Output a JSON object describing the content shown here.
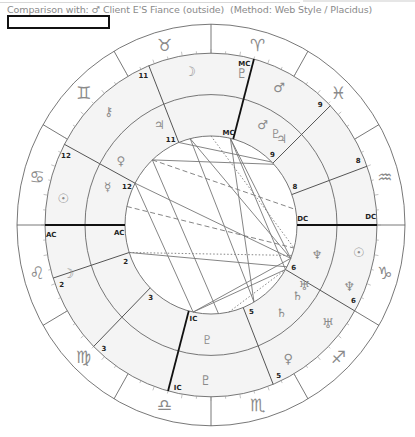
{
  "header": {
    "comparison_label": "Comparison with:",
    "comparison_symbol": "♂",
    "comparison_name": "Client E'S Fiance (outside)",
    "method": "(Method: Web Style / Placidus)",
    "name_box_value": ""
  },
  "wheel": {
    "center": [
      211,
      225
    ],
    "radii": {
      "outer": 194,
      "zodiac_inner": 166,
      "middle": 126,
      "inner": 86
    },
    "y_scale": 1.035,
    "colors": {
      "ring_fill": "#f4f4f4",
      "line": "#555555",
      "axis": "#111111",
      "glyph": "#8a8a8a",
      "label": "#222222"
    },
    "zodiac": [
      {
        "sign": "Aquarius",
        "glyph": "♒",
        "angle": 15
      },
      {
        "sign": "Pisces",
        "glyph": "♓",
        "angle": 45
      },
      {
        "sign": "Aries",
        "glyph": "♈",
        "angle": 75
      },
      {
        "sign": "Taurus",
        "glyph": "♉",
        "angle": 105
      },
      {
        "sign": "Gemini",
        "glyph": "♊",
        "angle": 135
      },
      {
        "sign": "Cancer",
        "glyph": "♋",
        "angle": 165
      },
      {
        "sign": "Leo",
        "glyph": "♌",
        "angle": 195
      },
      {
        "sign": "Virgo",
        "glyph": "♍",
        "angle": 225
      },
      {
        "sign": "Libra",
        "glyph": "♎",
        "angle": 255
      },
      {
        "sign": "Scorpio",
        "glyph": "♏",
        "angle": 285
      },
      {
        "sign": "Sagittarius",
        "glyph": "♐",
        "angle": 315
      },
      {
        "sign": "Capricorn",
        "glyph": "♑",
        "angle": 345
      }
    ],
    "outer_houses": [
      {
        "label": "AC",
        "angle": 180,
        "bold": true
      },
      {
        "label": "2",
        "angle": 198
      },
      {
        "label": "3",
        "angle": 225
      },
      {
        "label": "IC",
        "angle": 255,
        "bold": true
      },
      {
        "label": "5",
        "angle": 292
      },
      {
        "label": "6",
        "angle": 330
      },
      {
        "label": "DC",
        "angle": 0,
        "bold": true
      },
      {
        "label": "8",
        "angle": 20
      },
      {
        "label": "9",
        "angle": 44
      },
      {
        "label": "MC",
        "angle": 75,
        "bold": true
      },
      {
        "label": "11",
        "angle": 112
      },
      {
        "label": "12",
        "angle": 152
      }
    ],
    "inner_houses": [
      {
        "label": "AC",
        "angle": 180,
        "bold": true
      },
      {
        "label": "2",
        "angle": 198
      },
      {
        "label": "3",
        "angle": 225
      },
      {
        "label": "IC",
        "angle": 255,
        "bold": true
      },
      {
        "label": "5",
        "angle": 292
      },
      {
        "label": "6",
        "angle": 330
      },
      {
        "label": "DC",
        "angle": 0,
        "bold": true
      },
      {
        "label": "8",
        "angle": 20
      },
      {
        "label": "9",
        "angle": 44
      },
      {
        "label": "MC",
        "angle": 75,
        "bold": true
      },
      {
        "label": "11",
        "angle": 112
      },
      {
        "label": "12",
        "angle": 152
      }
    ],
    "outer_planets": [
      {
        "name": "Moon",
        "glyph": "☽",
        "angle": 98
      },
      {
        "name": "Pluto",
        "glyph": "♇",
        "angle": 78
      },
      {
        "name": "Mars",
        "glyph": "♂",
        "angle": 63
      },
      {
        "name": "Chiron",
        "glyph": "⚷",
        "angle": 133
      },
      {
        "name": "Sun",
        "glyph": "☉",
        "angle": 170
      },
      {
        "name": "Moon2",
        "glyph": "☽",
        "angle": 198
      },
      {
        "name": "Sun2",
        "glyph": "☉",
        "angle": 350
      },
      {
        "name": "Neptune",
        "glyph": "♆",
        "angle": 337
      },
      {
        "name": "Uranus",
        "glyph": "♅",
        "angle": 321
      },
      {
        "name": "Venus",
        "glyph": "♀",
        "angle": 301
      },
      {
        "name": "Pluto2",
        "glyph": "♇",
        "angle": 268
      }
    ],
    "inner_planets": [
      {
        "name": "Jupiter",
        "glyph": "♃",
        "angle": 118
      },
      {
        "name": "Venus",
        "glyph": "♀",
        "angle": 145
      },
      {
        "name": "Mercury",
        "glyph": "☿",
        "angle": 160
      },
      {
        "name": "Mars",
        "glyph": "♂",
        "angle": 62
      },
      {
        "name": "Jupiter2",
        "glyph": "♃",
        "angle": 50
      },
      {
        "name": "Pluto",
        "glyph": "♇",
        "angle": 54
      },
      {
        "name": "Neptune",
        "glyph": "♆",
        "angle": 345
      },
      {
        "name": "Uranus",
        "glyph": "♅",
        "angle": 328
      },
      {
        "name": "Saturn",
        "glyph": "♄",
        "angle": 322
      },
      {
        "name": "Saturn2",
        "glyph": "♄",
        "angle": 310
      },
      {
        "name": "Pluto2",
        "glyph": "♇",
        "angle": 268
      }
    ],
    "aspects": [
      {
        "from": 112,
        "to": 45,
        "style": "solid"
      },
      {
        "from": 133,
        "to": 43,
        "style": "solid"
      },
      {
        "from": 152,
        "to": 258,
        "style": "solid"
      },
      {
        "from": 152,
        "to": 338,
        "style": "solid"
      },
      {
        "from": 104,
        "to": 338,
        "style": "solid"
      },
      {
        "from": 104,
        "to": 300,
        "style": "solid"
      },
      {
        "from": 77,
        "to": 300,
        "style": "solid"
      },
      {
        "from": 77,
        "to": 330,
        "style": "solid"
      },
      {
        "from": 77,
        "to": 338,
        "style": "solid"
      },
      {
        "from": 198,
        "to": 332,
        "style": "solid"
      },
      {
        "from": 133,
        "to": 275,
        "style": "solid"
      },
      {
        "from": 258,
        "to": 330,
        "style": "solid"
      },
      {
        "from": 258,
        "to": 338,
        "style": "solid"
      },
      {
        "from": 133,
        "to": 10,
        "style": "dashed"
      },
      {
        "from": 168,
        "to": 345,
        "style": "dashed"
      },
      {
        "from": 198,
        "to": 340,
        "style": "dotted"
      },
      {
        "from": 90,
        "to": 345,
        "style": "dotted"
      },
      {
        "from": 282,
        "to": 330,
        "style": "dotted"
      }
    ]
  }
}
